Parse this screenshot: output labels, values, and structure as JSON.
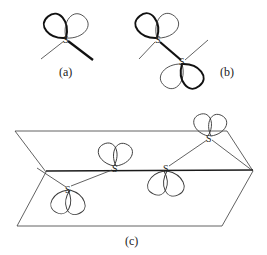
{
  "figure": {
    "panels": [
      {
        "id": "a",
        "label": "(a)",
        "atoms": [
          "S"
        ]
      },
      {
        "id": "b",
        "label": "(b)",
        "atoms": [
          "S",
          "S"
        ]
      },
      {
        "id": "c",
        "label": "(c)",
        "atoms": [
          "S",
          "S",
          "S",
          "S"
        ]
      }
    ]
  },
  "colors": {
    "line": "#3a3a3a",
    "thick_line": "#111111",
    "background": "#ffffff"
  }
}
